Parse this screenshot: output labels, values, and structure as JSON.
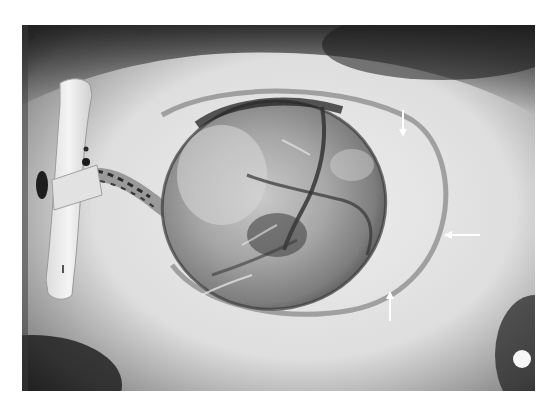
{
  "figure": {
    "panel_label": "a",
    "arrows": [
      {
        "id": "arrow-top",
        "direction": "down"
      },
      {
        "id": "arrow-right",
        "direction": "left"
      },
      {
        "id": "arrow-bottom",
        "direction": "up"
      }
    ],
    "colors": {
      "background_border": "#ffffff",
      "surface_light": "#e6e6e6",
      "surface_dark": "#2a2a2a",
      "sac_mid": "#a8a8a8",
      "arrow": "#ffffff"
    }
  }
}
